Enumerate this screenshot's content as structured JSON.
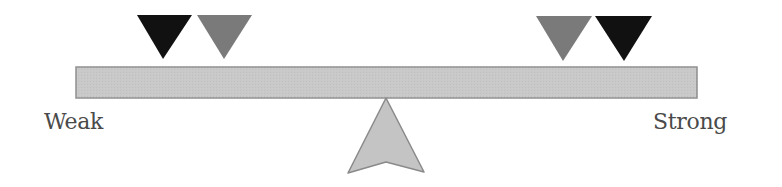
{
  "diagram": {
    "type": "balance-scale",
    "labels": {
      "left": "Weak",
      "right": "Strong"
    },
    "beam": {
      "x": 76,
      "y": 67,
      "width": 621,
      "height": 31,
      "fill": "#c9c9c9",
      "stroke": "#8f8f8f"
    },
    "fulcrum": {
      "points": "386,98 424,172 386,162 348,173",
      "fill": "#c4c4c4",
      "stroke": "#8a8a8a"
    },
    "markers": [
      {
        "id": "left-dark",
        "color": "#111111",
        "points": "137,15 192,15 163,59"
      },
      {
        "id": "left-gray",
        "color": "#7a7a7a",
        "points": "197,15 252,15 224,59"
      },
      {
        "id": "right-gray",
        "color": "#7a7a7a",
        "points": "536,16 592,16 563,61"
      },
      {
        "id": "right-dark",
        "color": "#111111",
        "points": "595,16 652,16 624,61"
      }
    ]
  }
}
